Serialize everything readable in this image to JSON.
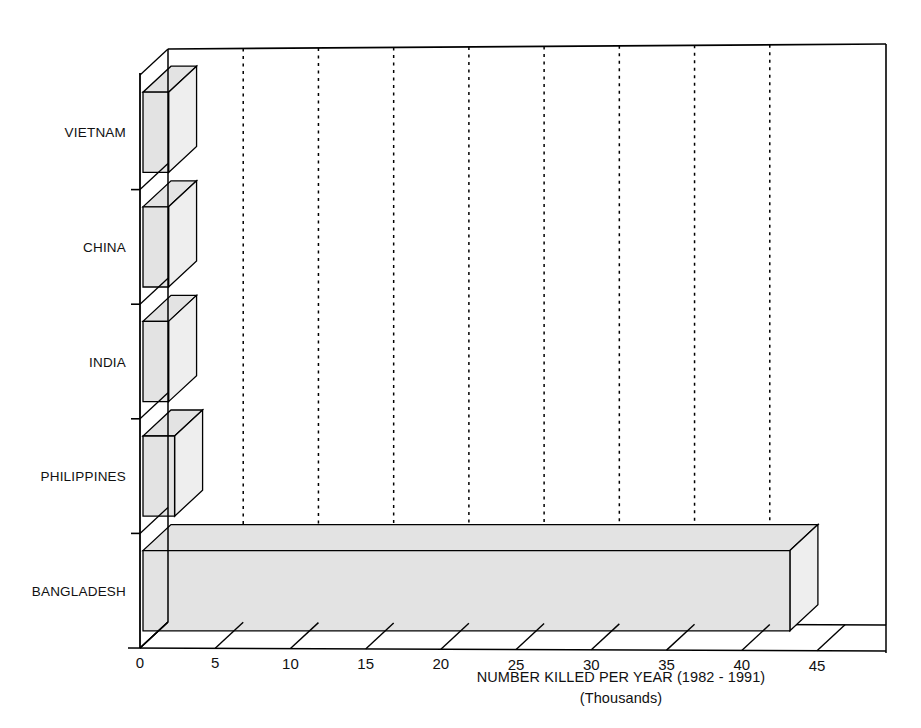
{
  "chart_data": {
    "type": "bar",
    "orientation": "horizontal",
    "style": "3d",
    "title": "",
    "xlabel": "NUMBER KILLED PER YEAR (1982 - 1991)",
    "xlabel_sub": "(Thousands)",
    "ylabel": "",
    "categories": [
      "VIETNAM",
      "CHINA",
      "INDIA",
      "PHILIPPINES",
      "BANGLADESH"
    ],
    "values": [
      1.7,
      1.7,
      1.7,
      2.1,
      43
    ],
    "xlim": [
      0,
      45
    ],
    "xticks": [
      0,
      5,
      10,
      15,
      20,
      25,
      30,
      35,
      40,
      45
    ],
    "xtick_labels": [
      "0",
      "5",
      "10",
      "15",
      "20",
      "25",
      "30",
      "35",
      "40",
      "45"
    ],
    "grid": "vertical-dotted",
    "legend": "none",
    "bar_fill_color": "#e3e3e3",
    "bar_edge_color": "#000000",
    "background_color": "#ffffff"
  },
  "axis": {
    "x_title_line1": "NUMBER KILLED PER YEAR (1982 - 1991)",
    "x_title_line2": "(Thousands)"
  }
}
